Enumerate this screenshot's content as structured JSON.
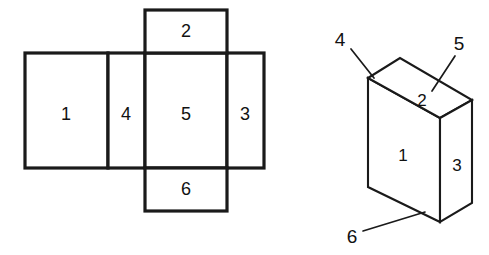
{
  "figure": {
    "background_color": "#ffffff",
    "line_color": "#1a1a1a",
    "face_fill_color": "#ffffff"
  },
  "net": {
    "name": "unfolded-net",
    "faces": [
      {
        "id": "net-face-1",
        "label": "1",
        "x": 25,
        "y": 53,
        "w": 83,
        "h": 115,
        "label_x": 66,
        "label_y": 115
      },
      {
        "id": "net-face-4",
        "label": "4",
        "x": 108,
        "y": 53,
        "w": 37,
        "h": 115,
        "label_x": 126,
        "label_y": 115
      },
      {
        "id": "net-face-5",
        "label": "5",
        "x": 145,
        "y": 53,
        "w": 82,
        "h": 115,
        "label_x": 186,
        "label_y": 115
      },
      {
        "id": "net-face-3",
        "label": "3",
        "x": 227,
        "y": 53,
        "w": 37,
        "h": 115,
        "label_x": 245,
        "label_y": 115
      },
      {
        "id": "net-face-2",
        "label": "2",
        "x": 145,
        "y": 10,
        "w": 82,
        "h": 43,
        "label_x": 186,
        "label_y": 32
      },
      {
        "id": "net-face-6",
        "label": "6",
        "x": 145,
        "y": 168,
        "w": 82,
        "h": 43,
        "label_x": 186,
        "label_y": 190
      }
    ]
  },
  "box": {
    "name": "assembled-box",
    "faces": [
      {
        "id": "box-face-front",
        "label": "1",
        "points": "368,78 440,118 440,222 368,187",
        "label_x": 403,
        "label_y": 157
      },
      {
        "id": "box-face-top",
        "label": "2",
        "points": "368,78 400,58 472,100 440,118",
        "label_x": 422,
        "label_y": 102
      },
      {
        "id": "box-face-side",
        "label": "3",
        "points": "440,118 472,100 472,203 440,222",
        "label_x": 457,
        "label_y": 167
      }
    ]
  },
  "callouts": [
    {
      "id": "callout-4",
      "label": "4",
      "label_x": 340,
      "label_y": 41,
      "line": "351,49 374,78"
    },
    {
      "id": "callout-5",
      "label": "5",
      "label_x": 459,
      "label_y": 45,
      "line": "455,56 432,91"
    },
    {
      "id": "callout-6",
      "label": "6",
      "label_x": 352,
      "label_y": 238,
      "line": "363,231 425,212"
    }
  ]
}
